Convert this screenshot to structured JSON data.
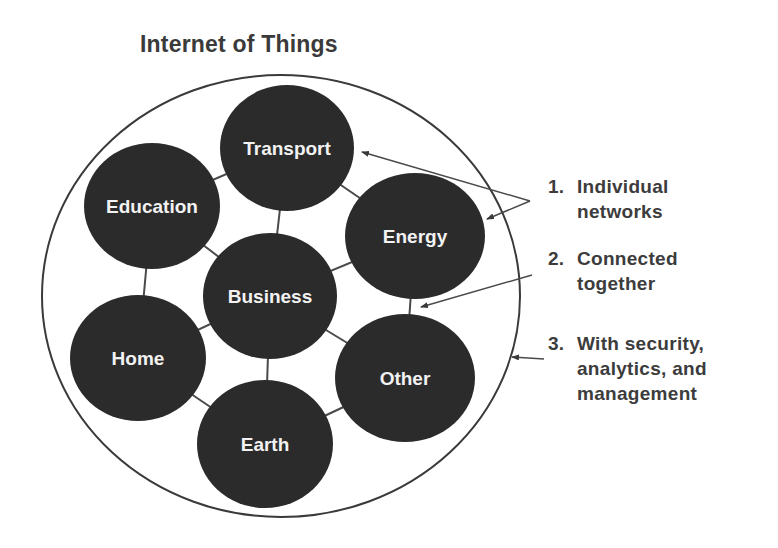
{
  "title": "Internet of Things",
  "colors": {
    "node_fill": "#2b2b2b",
    "node_text": "#f2f2f2",
    "line": "#4a4a4a",
    "text": "#3c3c3c",
    "background": "#ffffff"
  },
  "container": {
    "shape": "ellipse",
    "cx": 281,
    "cy": 296,
    "rx": 239,
    "ry": 221
  },
  "nodes": [
    {
      "id": "transport",
      "label": "Transport",
      "cx": 287,
      "cy": 148,
      "rx": 67,
      "ry": 63
    },
    {
      "id": "education",
      "label": "Education",
      "cx": 152,
      "cy": 206,
      "rx": 68,
      "ry": 63
    },
    {
      "id": "energy",
      "label": "Energy",
      "cx": 415,
      "cy": 236,
      "rx": 70,
      "ry": 63
    },
    {
      "id": "business",
      "label": "Business",
      "cx": 270,
      "cy": 296,
      "rx": 67,
      "ry": 63
    },
    {
      "id": "home",
      "label": "Home",
      "cx": 138,
      "cy": 358,
      "rx": 68,
      "ry": 63
    },
    {
      "id": "other",
      "label": "Other",
      "cx": 405,
      "cy": 378,
      "rx": 70,
      "ry": 64
    },
    {
      "id": "earth",
      "label": "Earth",
      "cx": 265,
      "cy": 444,
      "rx": 68,
      "ry": 64
    }
  ],
  "edges": [
    [
      "education",
      "transport"
    ],
    [
      "transport",
      "energy"
    ],
    [
      "transport",
      "business"
    ],
    [
      "education",
      "business"
    ],
    [
      "education",
      "home"
    ],
    [
      "energy",
      "business"
    ],
    [
      "energy",
      "other"
    ],
    [
      "business",
      "home"
    ],
    [
      "business",
      "other"
    ],
    [
      "business",
      "earth"
    ],
    [
      "home",
      "earth"
    ],
    [
      "earth",
      "other"
    ]
  ],
  "annotations": [
    {
      "number": "1.",
      "lines": [
        "Individual",
        "networks"
      ],
      "top": 174
    },
    {
      "number": "2.",
      "lines": [
        "Connected",
        "together"
      ],
      "top": 246
    },
    {
      "number": "3.",
      "lines": [
        "With security,",
        "analytics, and",
        "management"
      ],
      "top": 331
    }
  ],
  "arrows": [
    {
      "from": [
        530,
        201
      ],
      "to": [
        362,
        152
      ],
      "label_ref": "1."
    },
    {
      "from": [
        530,
        201
      ],
      "to": [
        487,
        219
      ],
      "label_ref": "1."
    },
    {
      "from": [
        532,
        275
      ],
      "to": [
        421,
        307
      ],
      "label_ref": "2."
    },
    {
      "from": [
        544,
        359
      ],
      "to": [
        512,
        357
      ],
      "label_ref": "3."
    }
  ]
}
